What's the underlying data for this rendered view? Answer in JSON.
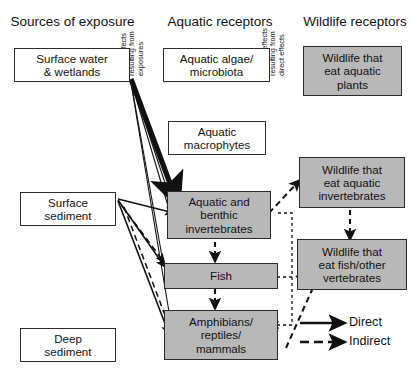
{
  "diagram": {
    "columns": [
      {
        "id": "sources",
        "header": "Sources of\nexposure"
      },
      {
        "id": "aquatic",
        "header": "Aquatic\nreceptors"
      },
      {
        "id": "wildlife",
        "header": "Wildlife\nreceptors"
      }
    ],
    "vertical_labels": [
      {
        "id": "direct-effects",
        "text": "Direct effects\nresulting from\nexposures"
      },
      {
        "id": "indirect-effects",
        "text": "Indirect effects\nresulting from\ndirect effects"
      }
    ],
    "boxes": [
      {
        "id": "surface-water",
        "label": "Surface water\n& wetlands",
        "shaded": false
      },
      {
        "id": "surface-sediment",
        "label": "Surface\nsediment",
        "shaded": false
      },
      {
        "id": "deep-sediment",
        "label": "Deep\nsediment",
        "shaded": false
      },
      {
        "id": "aquatic-algae",
        "label": "Aquatic algae/\nmicrobiota",
        "shaded": false
      },
      {
        "id": "aquatic-macrophytes",
        "label": "Aquatic\nmacrophytes",
        "shaded": false
      },
      {
        "id": "benthic-invertebrates",
        "label": "Aquatic and\nbenthic\ninvertebrates",
        "shaded": true
      },
      {
        "id": "fish",
        "label": "Fish",
        "shaded": true
      },
      {
        "id": "amphibians",
        "label": "Amphibians/\nreptiles/\nmammals",
        "shaded": true
      },
      {
        "id": "wildlife-plants",
        "label": "Wildlife that\neat aquatic\nplants",
        "shaded": true
      },
      {
        "id": "wildlife-inverts",
        "label": "Wildlife that\neat aquatic\ninvertebrates",
        "shaded": true
      },
      {
        "id": "wildlife-fish",
        "label": "Wildlife that\neat fish/other\nvertebrates",
        "shaded": true
      }
    ],
    "legend": {
      "items": [
        {
          "id": "direct",
          "label": "Direct",
          "style": "solid"
        },
        {
          "id": "indirect",
          "label": "Indirect",
          "style": "dashed"
        }
      ]
    },
    "colors": {
      "shaded_fill": "#b8b8b8",
      "box_border": "#2b2b2b",
      "line": "#111111",
      "background": "#ffffff"
    }
  }
}
